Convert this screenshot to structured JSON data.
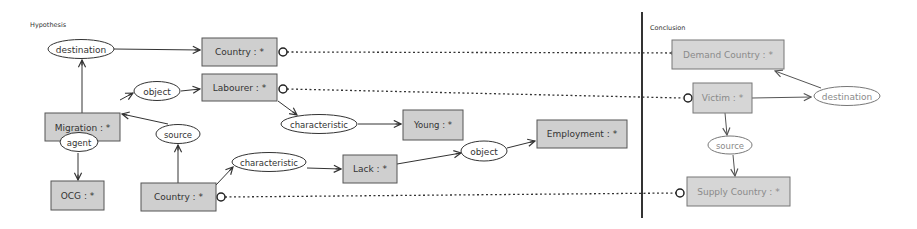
{
  "sections": {
    "hypothesis": {
      "label": "Hypothesis"
    },
    "conclusion": {
      "label": "Conclusion"
    }
  },
  "colors": {
    "box_fill": "#cfcfcf",
    "box_stroke": "#555555",
    "faded_box_fill": "#d6d6d6",
    "faded_text": "#8a8a8a",
    "line": "#333333"
  },
  "hypothesis": {
    "concepts": {
      "country_top": "Country : *",
      "labourer": "Labourer : *",
      "migration": "Migration : *",
      "young": "Young : *",
      "employment": "Employment : *",
      "ocg": "OCG : *",
      "country_bottom": "Country : *",
      "lack": "Lack : *"
    },
    "relations": {
      "destination": "destination",
      "object_upper": "object",
      "characteristic_upper": "characteristic",
      "agent": "agent",
      "source": "source",
      "characteristic_lower": "characteristic",
      "object_lower": "object"
    }
  },
  "conclusion": {
    "concepts": {
      "demand_country": "Demand Country : *",
      "victim": "Victim : *",
      "supply_country": "Supply Country : *"
    },
    "relations": {
      "destination": "destination",
      "source": "source"
    }
  },
  "coreference_links": [
    {
      "from": "Country : *",
      "to": "Demand Country : *"
    },
    {
      "from": "Labourer : *",
      "to": "Victim : *"
    },
    {
      "from": "Country : *",
      "to": "Supply Country : *"
    }
  ]
}
